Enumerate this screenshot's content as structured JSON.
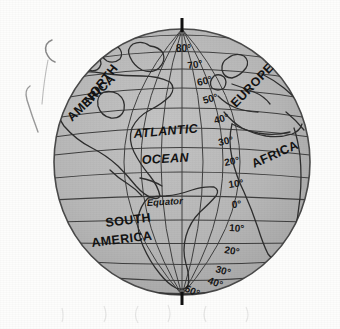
{
  "figure": {
    "kind": "globe-diagram",
    "projection": "orthographic",
    "centered_on": "Atlantic Ocean",
    "background_color": "#fdfdfc",
    "globe_fill_color": "#b8b8b8",
    "line_color": "#3a3a3a",
    "text_color": "#131313"
  },
  "globe": {
    "center_x": 182,
    "center_y": 162,
    "radius_x": 128,
    "radius_y": 133
  },
  "poles": {
    "north_tick_label": "north-pole-axis-tick",
    "south_tick_label": "south-pole-axis-tick"
  },
  "equator": {
    "label": "Equator"
  },
  "latitudes_north": [
    {
      "label": "80°",
      "value": 80
    },
    {
      "label": "70°",
      "value": 70
    },
    {
      "label": "60°",
      "value": 60
    },
    {
      "label": "50°",
      "value": 50
    },
    {
      "label": "40°",
      "value": 40
    },
    {
      "label": "30°",
      "value": 30
    },
    {
      "label": "20°",
      "value": 20
    },
    {
      "label": "10°",
      "value": 10
    }
  ],
  "latitude_equator": {
    "label": "0°",
    "value": 0
  },
  "latitudes_south": [
    {
      "label": "10°",
      "value": -10
    },
    {
      "label": "20°",
      "value": -20
    },
    {
      "label": "30°",
      "value": -30
    },
    {
      "label": "40°",
      "value": -40
    },
    {
      "label": "50°",
      "value": -50
    }
  ],
  "places": [
    {
      "name": "NORTH",
      "key": "north"
    },
    {
      "name": "AMERICA",
      "key": "america_north"
    },
    {
      "name": "ATLANTIC",
      "key": "atlantic"
    },
    {
      "name": "OCEAN",
      "key": "ocean"
    },
    {
      "name": "SOUTH",
      "key": "south"
    },
    {
      "name": "AMERICA",
      "key": "america_south"
    },
    {
      "name": "EUROPE",
      "key": "europe"
    },
    {
      "name": "AFRICA",
      "key": "africa"
    }
  ],
  "artifacts": {
    "stray_mark_upper": "pencil-stray-mark-upper",
    "stray_mark_lower": "pencil-stray-mark-lower"
  }
}
